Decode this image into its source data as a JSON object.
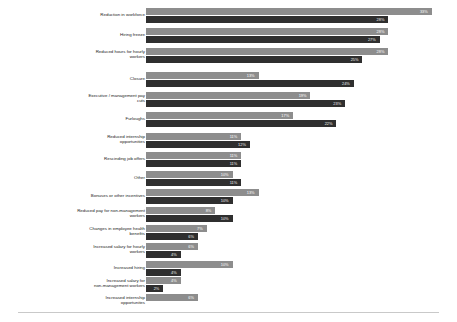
{
  "chart_data": {
    "type": "bar",
    "orientation": "horizontal",
    "title": "",
    "subtitle": "",
    "xlabel": "",
    "ylabel": "",
    "grid": false,
    "legend_position": "none",
    "xlim": [
      0,
      35
    ],
    "value_suffix": "%",
    "categories": [
      "Reduction in workforce",
      "Hiring freeze",
      "Reduced hours for hourly\nworkers",
      "Closure",
      "Executive / management pay\ncuts",
      "Furloughs",
      "Reduced internship\nopportunities",
      "Rescinding job offers",
      "Other",
      "Bonuses or other incentives",
      "Reduced pay for non-management\nworkers",
      "Changes in employee health\nbenefits",
      "Increased salary for hourly\nworkers",
      "Increased hiring",
      "Increased salary for\nnon-management workers",
      "Increased internship\nopportunites"
    ],
    "series": [
      {
        "name": "series-1",
        "color": "#8d8d8d",
        "values": [
          33,
          28,
          28,
          13,
          19,
          17,
          11,
          11,
          10,
          13,
          8,
          7,
          6,
          10,
          4,
          6
        ]
      },
      {
        "name": "series-2",
        "color": "#2f2f2f",
        "values": [
          28,
          27,
          25,
          24,
          23,
          22,
          12,
          11,
          11,
          10,
          10,
          6,
          4,
          4,
          2,
          0
        ]
      }
    ],
    "labels": {
      "series_1_display": [
        "33%",
        "28%",
        "28%",
        "13%",
        "19%",
        "17%",
        "11%",
        "11%",
        "10%",
        "13%",
        "8%",
        "7%",
        "6%",
        "10%",
        "4%",
        "6%"
      ],
      "series_2_display": [
        "28%",
        "27%",
        "25%",
        "24%",
        "23%",
        "22%",
        "12%",
        "11%",
        "11%",
        "10%",
        "10%",
        "6%",
        "4%",
        "4%",
        "2%",
        ""
      ]
    }
  }
}
